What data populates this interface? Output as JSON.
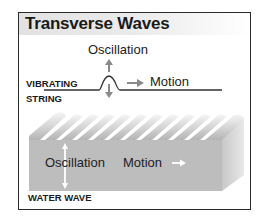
{
  "title": "Transverse Waves",
  "string_section": {
    "label_line1": "VIBRATING",
    "label_line2": "STRING",
    "oscillation_label": "Oscillation",
    "motion_label": "Motion"
  },
  "water_section": {
    "label": "WATER WAVE",
    "oscillation_label": "Oscillation",
    "motion_label": "Motion"
  },
  "colors": {
    "frame": "#2b2b2b",
    "arrow_gray": "#8a8a8a",
    "water_front": "#bdbdbd",
    "water_highlight": "#f2f2f2",
    "text": "#222222"
  }
}
